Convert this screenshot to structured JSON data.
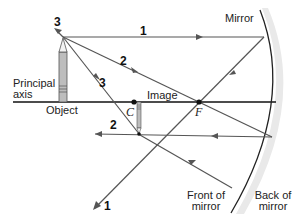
{
  "diagram": {
    "labels": {
      "mirror": "Mirror",
      "principal_axis_line1": "Principal",
      "principal_axis_line2": "axis",
      "object": "Object",
      "image": "Image",
      "center_of_curvature": "C",
      "focal_point": "F",
      "front_line1": "Front of",
      "front_line2": "mirror",
      "back_line1": "Back of",
      "back_line2": "mirror"
    },
    "ray_numbers": {
      "ray1_incident": "1",
      "ray1_reflected": "1",
      "ray2_incident": "2",
      "ray2_reflected": "2",
      "ray3_incident": "3",
      "ray3_reflected": "3"
    },
    "colors": {
      "ray": "#555555",
      "axis": "#111111",
      "mirror": "#222222",
      "mirror_shade": "#e6e6e6",
      "pencil_body": "#bdbdbd",
      "pencil_outline": "#555555"
    }
  }
}
